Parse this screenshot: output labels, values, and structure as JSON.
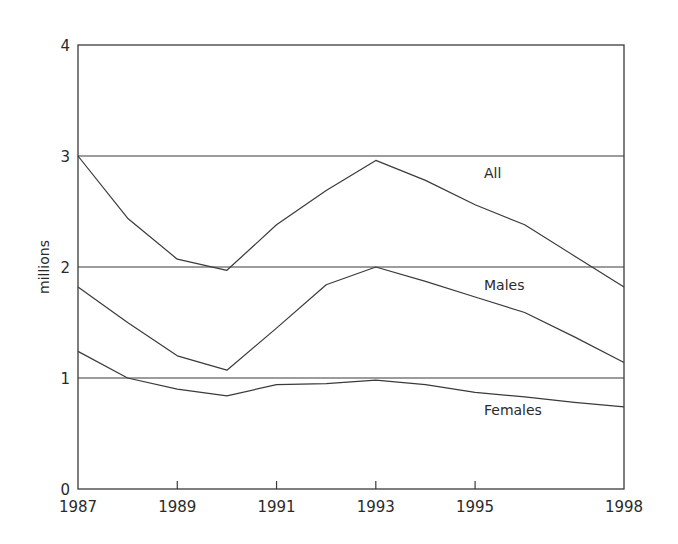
{
  "chart_data": {
    "type": "line",
    "title": "",
    "xlabel": "",
    "ylabel": "millions",
    "x": [
      1987,
      1988,
      1989,
      1990,
      1991,
      1992,
      1993,
      1994,
      1995,
      1996,
      1997,
      1998
    ],
    "xticks": [
      "1987",
      "1989",
      "1991",
      "1993",
      "1995",
      "1998"
    ],
    "yticks": [
      "0",
      "1",
      "2",
      "3",
      "4"
    ],
    "ylim": [
      0,
      4
    ],
    "xlim": [
      1987,
      1998
    ],
    "grid": "horizontal at 1, 2, 3",
    "legend": "inline labels",
    "series": [
      {
        "name": "All",
        "values": [
          3.0,
          2.44,
          2.07,
          1.97,
          2.38,
          2.69,
          2.96,
          2.78,
          2.56,
          2.38,
          2.1,
          1.82
        ]
      },
      {
        "name": "Males",
        "values": [
          1.82,
          1.5,
          1.2,
          1.07,
          1.45,
          1.84,
          2.0,
          1.87,
          1.73,
          1.59,
          1.37,
          1.14
        ]
      },
      {
        "name": "Females",
        "values": [
          1.24,
          1.0,
          0.9,
          0.84,
          0.94,
          0.95,
          0.98,
          0.94,
          0.87,
          0.83,
          0.78,
          0.74
        ]
      }
    ]
  },
  "labels": {
    "ylabel": "millions",
    "all": "All",
    "males": "Males",
    "females": "Females"
  }
}
